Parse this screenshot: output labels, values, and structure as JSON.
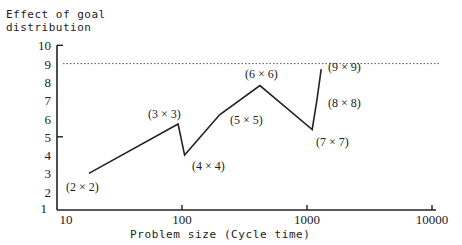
{
  "chart_data": {
    "type": "line",
    "title": "",
    "ylabel": "Effect of goal distribution",
    "ylabel_lines": [
      "Effect of goal",
      "distribution"
    ],
    "xlabel": "Problem size (Cycle time)",
    "xscale": "log",
    "xlim": [
      10,
      10000
    ],
    "ylim": [
      1,
      10
    ],
    "xticks": [
      10,
      100,
      1000,
      10000
    ],
    "xtick_labels": [
      "10",
      "100",
      "1000",
      "10000"
    ],
    "yticks": [
      1,
      2,
      3,
      4,
      5,
      6,
      7,
      8,
      9,
      10
    ],
    "ytick_labels": [
      "1",
      "2",
      "3",
      "4",
      "5",
      "6",
      "7",
      "8",
      "9",
      "10"
    ],
    "reference_line": {
      "y": 9,
      "style": "dotted"
    },
    "grid": false,
    "series": [
      {
        "name": "Effect of goal distribution",
        "x": [
          18,
          93,
          105,
          200,
          420,
          1100,
          1200,
          1300
        ],
        "y": [
          3.0,
          5.7,
          4.0,
          6.2,
          7.8,
          5.4,
          7.0,
          8.7
        ]
      }
    ],
    "annotations": [
      {
        "text": "(2 × 2)",
        "x": 18,
        "y": 3.0
      },
      {
        "text": "(3 × 3)",
        "x": 93,
        "y": 5.7
      },
      {
        "text": "(4 × 4)",
        "x": 105,
        "y": 4.0
      },
      {
        "text": "(5 × 5)",
        "x": 200,
        "y": 6.2
      },
      {
        "text": "(6 × 6)",
        "x": 420,
        "y": 7.8
      },
      {
        "text": "(7 × 7)",
        "x": 1100,
        "y": 5.4
      },
      {
        "text": "(8 × 8)",
        "x": 1200,
        "y": 7.0
      },
      {
        "text": "(9 × 9)",
        "x": 1300,
        "y": 8.7
      }
    ],
    "annotation_positions": [
      [
        66,
        191
      ],
      [
        148,
        118
      ],
      [
        192,
        170
      ],
      [
        230,
        124
      ],
      [
        245,
        78
      ],
      [
        316,
        146
      ],
      [
        328,
        107
      ],
      [
        328,
        71
      ]
    ]
  }
}
